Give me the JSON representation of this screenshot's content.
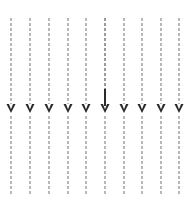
{
  "canvas": {
    "width": 192,
    "height": 207,
    "background_color": "#ffffff",
    "title": "Downward dashed flow lines with arrowheads"
  },
  "style": {
    "dash_color": "#b8b8b8",
    "dash_color_emphasis": "#9a9a9a",
    "arrow_color": "#2b2b2b",
    "line_width": 1.1,
    "dash_pattern": "3 2",
    "arrow_width": 9,
    "arrow_height": 9
  },
  "geometry": {
    "line_top_y": 18,
    "line_bottom_y": 194,
    "arrow_tip_y": 113,
    "column_count": 10
  },
  "chart_data": {
    "type": "line",
    "title": "",
    "xlabel": "",
    "ylabel": "",
    "grid": false,
    "legend": null,
    "columns": [
      {
        "index": 1,
        "x": 11,
        "top_y": 18,
        "bottom_y": 194,
        "arrow_tip_y": 113,
        "emphasis": false,
        "label": ""
      },
      {
        "index": 2,
        "x": 30,
        "top_y": 18,
        "bottom_y": 194,
        "arrow_tip_y": 113,
        "emphasis": false,
        "label": ""
      },
      {
        "index": 3,
        "x": 49,
        "top_y": 18,
        "bottom_y": 194,
        "arrow_tip_y": 113,
        "emphasis": false,
        "label": ""
      },
      {
        "index": 4,
        "x": 68,
        "top_y": 18,
        "bottom_y": 194,
        "arrow_tip_y": 113,
        "emphasis": false,
        "label": ""
      },
      {
        "index": 5,
        "x": 86,
        "top_y": 18,
        "bottom_y": 194,
        "arrow_tip_y": 113,
        "emphasis": false,
        "label": ""
      },
      {
        "index": 6,
        "x": 105,
        "top_y": 18,
        "bottom_y": 194,
        "arrow_tip_y": 113,
        "emphasis": true,
        "label": ""
      },
      {
        "index": 7,
        "x": 124,
        "top_y": 18,
        "bottom_y": 194,
        "arrow_tip_y": 113,
        "emphasis": false,
        "label": ""
      },
      {
        "index": 8,
        "x": 142,
        "top_y": 18,
        "bottom_y": 194,
        "arrow_tip_y": 113,
        "emphasis": false,
        "label": ""
      },
      {
        "index": 9,
        "x": 161,
        "top_y": 18,
        "bottom_y": 194,
        "arrow_tip_y": 113,
        "emphasis": false,
        "label": ""
      },
      {
        "index": 10,
        "x": 179,
        "top_y": 18,
        "bottom_y": 194,
        "arrow_tip_y": 113,
        "emphasis": false,
        "label": ""
      }
    ]
  }
}
